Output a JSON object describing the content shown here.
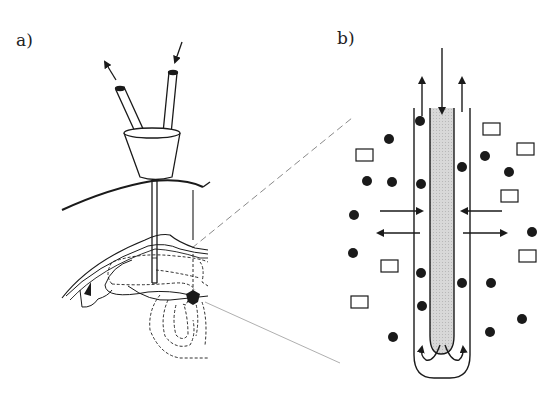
{
  "figure": {
    "panels": [
      {
        "id": "a",
        "label": "a)",
        "description": "Microdialysis probe with inlet/outlet tubes and hub inserted into a coronal brain section"
      },
      {
        "id": "b",
        "label": "b)",
        "description": "Enlarged schematic of probe tip showing perfusate flow and molecular exchange across the membrane"
      }
    ],
    "legend_symbols": {
      "filled_circle": "small molecule (diffusible)",
      "open_square": "large molecule"
    },
    "colors": {
      "line": "#1a1a1a",
      "lumen_fill": "#d6d6d6",
      "zoom_guide": "#8a8a8a"
    }
  }
}
